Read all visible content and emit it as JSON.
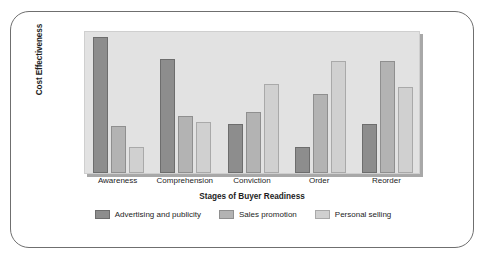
{
  "chart_data": {
    "type": "bar",
    "title": "",
    "xlabel": "Stages of Buyer Readiness",
    "ylabel": "Cost Effectiveness",
    "categories": [
      "Awareness",
      "Comprehension",
      "Conviction",
      "Order",
      "Reorder"
    ],
    "series": [
      {
        "name": "Advertising and publicity",
        "color": "#8d8d8d",
        "values": [
          95,
          80,
          34,
          18,
          34
        ]
      },
      {
        "name": "Sales promotion",
        "color": "#b3b3b3",
        "values": [
          33,
          40,
          43,
          55,
          78
        ]
      },
      {
        "name": "Personal selling",
        "color": "#d0d0d0",
        "values": [
          18,
          36,
          62,
          78,
          60
        ]
      }
    ],
    "ylim": [
      0,
      100
    ],
    "y_tick_labels": [],
    "grid": false,
    "legend_position": "bottom",
    "plot_background": "#e2e2e2"
  },
  "legend": {
    "items": [
      {
        "label": "Advertising and publicity"
      },
      {
        "label": "Sales promotion"
      },
      {
        "label": "Personal selling"
      }
    ]
  }
}
